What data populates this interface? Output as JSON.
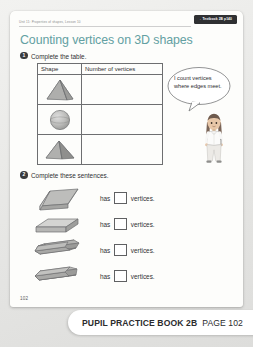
{
  "page": {
    "running_head": "Unit 11: Properties of shapes, Lesson 10",
    "title": "Counting vertices on 3D shapes",
    "folio": "102",
    "badge": {
      "arrow": "→",
      "label": "Textbook 2B p140"
    }
  },
  "questions": [
    {
      "number": "1",
      "instruction": "Complete the table."
    },
    {
      "number": "2",
      "instruction": "Complete these sentences."
    }
  ],
  "table": {
    "headers": [
      "Shape",
      "Number of vertices"
    ],
    "rows": [
      {
        "shape_icon": "triangular-pyramid-icon",
        "answer": ""
      },
      {
        "shape_icon": "sphere-icon",
        "answer": ""
      },
      {
        "shape_icon": "square-pyramid-icon",
        "answer": ""
      }
    ]
  },
  "speech_bubble": {
    "text": "I count vertices where edges meet.",
    "speaker_icon": "girl-character-icon"
  },
  "sentences": {
    "has_label": "has",
    "tail_label": "vertices.",
    "rows": [
      {
        "shape_icon": "triangular-prism-icon",
        "answer": ""
      },
      {
        "shape_icon": "cuboid-icon",
        "answer": ""
      },
      {
        "shape_icon": "hexagonal-prism-icon",
        "answer": ""
      },
      {
        "shape_icon": "pentagonal-prism-icon",
        "answer": ""
      }
    ]
  },
  "footer": {
    "book_label": "PUPIL PRACTICE BOOK 2B",
    "page_label": "PAGE 102"
  },
  "colors": {
    "title": "#63a0a2",
    "badge_bg": "#2f3032",
    "ink": "#2f3032",
    "shape_fill": "#b9b9b7",
    "shape_stroke": "#6d6e70"
  }
}
